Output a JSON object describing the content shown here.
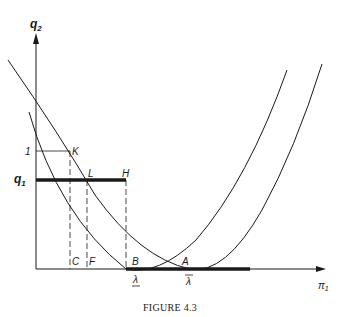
{
  "figure": {
    "caption": "FIGURE 4.3",
    "y_axis_label": "q",
    "y_axis_sub": "2",
    "x_axis_label": "π",
    "x_axis_sub": "1",
    "q1_label": "q",
    "q1_sub": "1",
    "one_label": "1",
    "points": {
      "K": "K",
      "L": "L",
      "H": "H",
      "C": "C",
      "F": "F",
      "B": "B",
      "A": "A"
    },
    "lambda_lower": "λ",
    "lambda_upper": "λ",
    "colors": {
      "ink": "#1a1a1a",
      "background": "#ffffff"
    }
  }
}
